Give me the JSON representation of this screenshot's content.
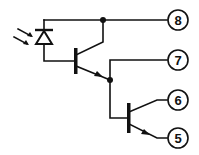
{
  "diagram": {
    "type": "circuit-schematic",
    "colors": {
      "line": "#111111",
      "background": "#ffffff"
    },
    "components": [
      {
        "id": "photodiode",
        "kind": "photodiode"
      },
      {
        "id": "q1",
        "kind": "npn-transistor"
      },
      {
        "id": "q2",
        "kind": "npn-transistor"
      }
    ],
    "pins": [
      {
        "label": "8"
      },
      {
        "label": "7"
      },
      {
        "label": "6"
      },
      {
        "label": "5"
      }
    ]
  }
}
